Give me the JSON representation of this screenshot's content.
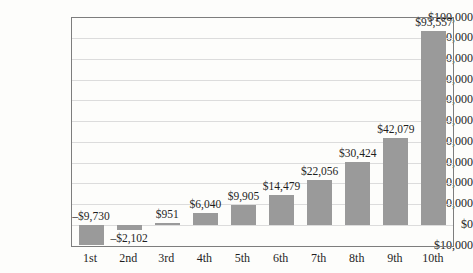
{
  "figure": {
    "background": "#fdfdfb"
  },
  "chart_data": {
    "type": "bar",
    "title": "",
    "xlabel": "",
    "ylabel": "",
    "categories": [
      "1st",
      "2nd",
      "3rd",
      "4th",
      "5th",
      "6th",
      "7th",
      "8th",
      "9th",
      "10th"
    ],
    "values": [
      -9730,
      -2102,
      951,
      6040,
      9905,
      14479,
      22056,
      30424,
      42079,
      93557
    ],
    "value_labels": [
      "–$9,730",
      "–$2,102",
      "$951",
      "$6,040",
      "$9,905",
      "$14,479",
      "$22,056",
      "$30,424",
      "$42,079",
      "$93,557"
    ],
    "value_label_positions": [
      "above_zero",
      "below_bar",
      "above_bar",
      "above_bar",
      "above_bar",
      "above_bar",
      "above_bar",
      "above_bar",
      "above_bar",
      "above_bar"
    ],
    "ylim": [
      -10000,
      100000
    ],
    "y_tick_step": 10000,
    "y_ticks": [
      {
        "value": 100000,
        "label": "$100,000"
      },
      {
        "value": 90000,
        "label": "$90,000"
      },
      {
        "value": 80000,
        "label": "$80,000"
      },
      {
        "value": 70000,
        "label": "$70,000"
      },
      {
        "value": 60000,
        "label": "$60,000"
      },
      {
        "value": 50000,
        "label": "$50,000"
      },
      {
        "value": 40000,
        "label": "$40,000"
      },
      {
        "value": 30000,
        "label": "$30,000"
      },
      {
        "value": 20000,
        "label": "$20,000"
      },
      {
        "value": 10000,
        "label": "$10,000"
      },
      {
        "value": 0,
        "label": "$0"
      },
      {
        "value": -10000,
        "label": "–$10,000"
      }
    ],
    "grid": "horizontal",
    "legend": "none",
    "colors": {
      "bar": "#9a9a9a",
      "gridline": "#dcdcdc",
      "plot_border": "#7d7d7d",
      "text": "#1f1f1f",
      "background": "#fdfdfb"
    }
  }
}
